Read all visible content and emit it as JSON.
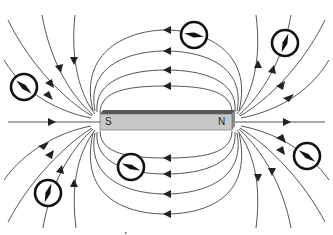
{
  "diagram": {
    "magnet": {
      "south_label": "S",
      "north_label": "N",
      "colors": {
        "front": "#c8c8c8",
        "top": "#555555",
        "end": "#8a8a8a"
      }
    },
    "compasses": [
      {
        "id": "upper-left",
        "cx": 24,
        "cy": 87,
        "angle": 40
      },
      {
        "id": "top-center",
        "cx": 194,
        "cy": 35,
        "angle": 10
      },
      {
        "id": "upper-right",
        "cx": 285,
        "cy": 43,
        "angle": -70
      },
      {
        "id": "lower-right",
        "cx": 307,
        "cy": 156,
        "angle": 35
      },
      {
        "id": "lower-center",
        "cx": 131,
        "cy": 167,
        "angle": 20
      },
      {
        "id": "lower-left",
        "cx": 48,
        "cy": 193,
        "angle": -70
      }
    ],
    "line_color": "#555555",
    "arrow_color": "#222222"
  }
}
